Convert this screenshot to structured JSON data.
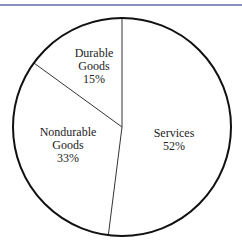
{
  "chart_data": {
    "type": "pie",
    "title": "",
    "categories": [
      "Services",
      "Nondurable Goods",
      "Durable Goods"
    ],
    "values": [
      52,
      33,
      15
    ],
    "unit": "%",
    "labels": [
      {
        "line1": "Services",
        "line2": "",
        "pct": "52%"
      },
      {
        "line1": "Nondurable",
        "line2": "Goods",
        "pct": "33%"
      },
      {
        "line1": "Durable",
        "line2": "Goods",
        "pct": "15%"
      }
    ],
    "start_angle_deg": 0,
    "direction": "clockwise",
    "fill": "#ffffff",
    "stroke": "#111111",
    "legend": "none"
  },
  "colors": {
    "top_rule": "#8a8fc0",
    "outline": "#111111",
    "text": "#222222"
  }
}
